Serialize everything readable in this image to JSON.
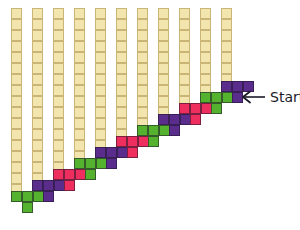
{
  "figure": {
    "title": "",
    "background_color": "#ffffff",
    "width": 300,
    "height": 230
  },
  "palette": {
    "column_fill": "#f2e5ae",
    "column_border": "#c9b676",
    "green": "#55b22e",
    "purple": "#5a2d8c",
    "pink": "#ed2e5e",
    "piece_border": "#2a1a33",
    "text": "#1b1b2a",
    "arrow": "#1b1b2a"
  },
  "grid": {
    "cell_size": 11,
    "column_pitch": 21,
    "first_column_x": 11,
    "columns_top_y": 8,
    "column_count": 11
  },
  "columns": [
    {
      "index": 1,
      "x": 11,
      "top": 8,
      "cells": 17,
      "bottom": 195
    },
    {
      "index": 2,
      "x": 32,
      "top": 8,
      "cells": 16,
      "bottom": 184
    },
    {
      "index": 3,
      "x": 53,
      "top": 8,
      "cells": 15,
      "bottom": 173
    },
    {
      "index": 4,
      "x": 74,
      "top": 8,
      "cells": 14,
      "bottom": 162
    },
    {
      "index": 5,
      "x": 95,
      "top": 8,
      "cells": 13,
      "bottom": 151
    },
    {
      "index": 6,
      "x": 116,
      "top": 8,
      "cells": 12,
      "bottom": 140
    },
    {
      "index": 7,
      "x": 137,
      "top": 8,
      "cells": 11,
      "bottom": 129
    },
    {
      "index": 8,
      "x": 158,
      "top": 8,
      "cells": 10,
      "bottom": 118
    },
    {
      "index": 9,
      "x": 179,
      "top": 8,
      "cells": 9,
      "bottom": 107
    },
    {
      "index": 10,
      "x": 200,
      "top": 8,
      "cells": 8,
      "bottom": 96
    },
    {
      "index": 11,
      "x": 221,
      "top": 8,
      "cells": 7,
      "bottom": 85
    }
  ],
  "pieces": [
    {
      "index": 1,
      "shape": "T-tetromino",
      "color_name": "green",
      "color": "#55b22e",
      "x": 11,
      "y": 191
    },
    {
      "index": 2,
      "shape": "T-tetromino",
      "color_name": "purple",
      "color": "#5a2d8c",
      "x": 32,
      "y": 180
    },
    {
      "index": 3,
      "shape": "T-tetromino",
      "color_name": "pink",
      "color": "#ed2e5e",
      "x": 53,
      "y": 169
    },
    {
      "index": 4,
      "shape": "T-tetromino",
      "color_name": "green",
      "color": "#55b22e",
      "x": 74,
      "y": 158
    },
    {
      "index": 5,
      "shape": "T-tetromino",
      "color_name": "purple",
      "color": "#5a2d8c",
      "x": 95,
      "y": 147
    },
    {
      "index": 6,
      "shape": "T-tetromino",
      "color_name": "pink",
      "color": "#ed2e5e",
      "x": 116,
      "y": 136
    },
    {
      "index": 7,
      "shape": "T-tetromino",
      "color_name": "green",
      "color": "#55b22e",
      "x": 137,
      "y": 125
    },
    {
      "index": 8,
      "shape": "T-tetromino",
      "color_name": "purple",
      "color": "#5a2d8c",
      "x": 158,
      "y": 114
    },
    {
      "index": 9,
      "shape": "T-tetromino",
      "color_name": "pink",
      "color": "#ed2e5e",
      "x": 179,
      "y": 103
    },
    {
      "index": 10,
      "shape": "T-tetromino",
      "color_name": "green",
      "color": "#55b22e",
      "x": 200,
      "y": 92
    },
    {
      "index": 11,
      "shape": "T-tetromino",
      "color_name": "purple",
      "color": "#5a2d8c",
      "x": 221,
      "y": 81
    }
  ],
  "annotation": {
    "label": "Start",
    "arrow_direction": "left",
    "x": 240,
    "y": 90
  }
}
